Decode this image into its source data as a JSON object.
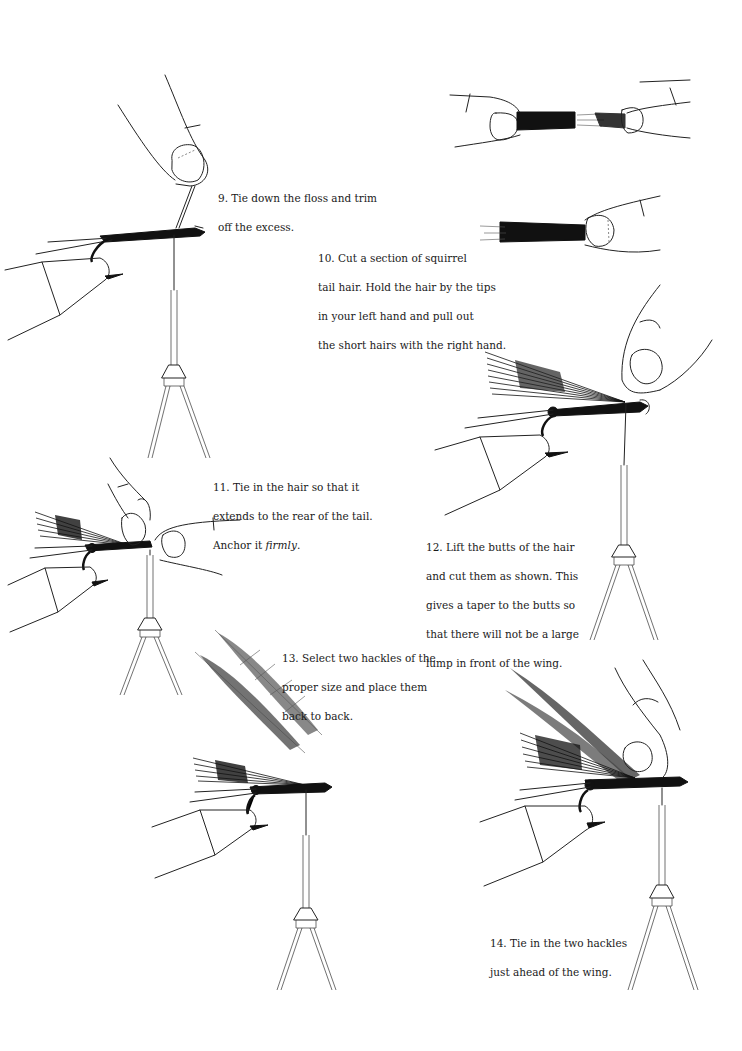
{
  "steps": [
    {
      "number": "9",
      "lines": [
        "9.  Tie down the floss and trim",
        "off the excess."
      ]
    },
    {
      "number": "10",
      "lines": [
        "10.  Cut a section of squirrel",
        "tail hair.  Hold the hair by the tips",
        "in your left hand and pull out",
        "the short hairs with the right hand."
      ]
    },
    {
      "number": "11",
      "lines": [
        "11.  Tie in the hair so that it",
        "extends to the rear of the tail.",
        "Anchor it "
      ],
      "emphasis": "firmly",
      "trail": "."
    },
    {
      "number": "12",
      "lines": [
        "12.  Lift the butts of the hair",
        "and cut them as shown.  This",
        "gives a taper to the butts  so",
        "that there will not be a large",
        "lump in front of the wing."
      ]
    },
    {
      "number": "13",
      "lines": [
        "13.  Select two hackles of the",
        "proper size and place them",
        "back to back."
      ]
    },
    {
      "number": "14",
      "lines": [
        "14.  Tie in the two hackles",
        "just ahead of the wing."
      ]
    }
  ],
  "illustrations": [
    {
      "id": "fig-9",
      "depicts": "hook in vise with floss tied down, fingers holding thread"
    },
    {
      "id": "fig-10a",
      "depicts": "two hands pulling squirrel tail hair apart"
    },
    {
      "id": "fig-10b",
      "depicts": "fingers holding tapered hair bundle"
    },
    {
      "id": "fig-11",
      "depicts": "hair wing tied in on hook, fingers anchoring"
    },
    {
      "id": "fig-12",
      "depicts": "hair wing lifted, butts cut"
    },
    {
      "id": "fig-13",
      "depicts": "two hackles back to back above fly with hair wing"
    },
    {
      "id": "fig-14",
      "depicts": "hackles tied in ahead of wing"
    }
  ]
}
